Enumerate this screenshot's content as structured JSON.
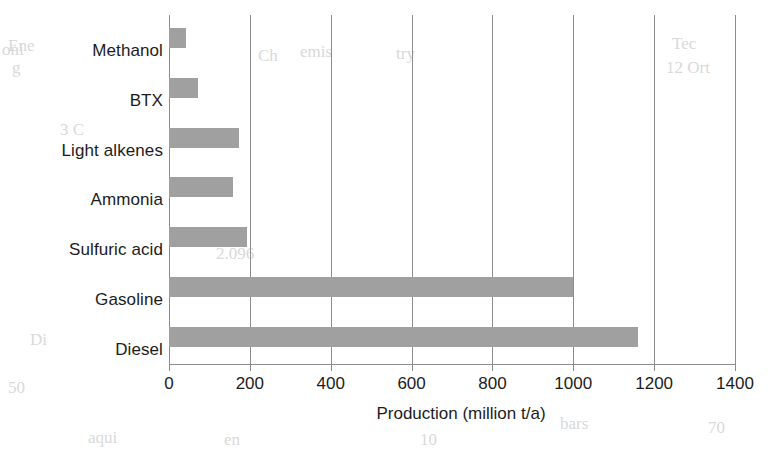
{
  "chart_data": {
    "type": "bar",
    "orientation": "horizontal",
    "title": "",
    "xlabel": "Production (million t/a)",
    "ylabel": "",
    "categories": [
      "Methanol",
      "BTX",
      "Light alkenes",
      "Ammonia",
      "Sulfuric acid",
      "Gasoline",
      "Diesel"
    ],
    "values": [
      42,
      72,
      173,
      158,
      193,
      1000,
      1160
    ],
    "xlim": [
      0,
      1400
    ],
    "xticks": [
      0,
      200,
      400,
      600,
      800,
      1000,
      1200,
      1400
    ],
    "xtick_labels": [
      "0",
      "200",
      "400",
      "600",
      "800",
      "1000",
      "1200",
      "1400"
    ],
    "grid": "vertical",
    "legend": "none",
    "bar_color": "#a0a0a0",
    "axis_color": "#8c8c8c",
    "background_color": "#ffffff"
  },
  "scan_artifacts": [
    {
      "text": "Ene",
      "left": 8,
      "top": 36
    },
    {
      "text": "oni",
      "left": 2,
      "top": 40
    },
    {
      "text": "g",
      "left": 12,
      "top": 58
    },
    {
      "text": "Ch",
      "left": 258,
      "top": 46
    },
    {
      "text": "emis",
      "left": 300,
      "top": 42
    },
    {
      "text": "try",
      "left": 396,
      "top": 44
    },
    {
      "text": "Tec",
      "left": 672,
      "top": 34
    },
    {
      "text": "12 Ort",
      "left": 666,
      "top": 58
    },
    {
      "text": "2.096",
      "left": 216,
      "top": 244
    },
    {
      "text": "Di",
      "left": 30,
      "top": 330
    },
    {
      "text": "3 C",
      "left": 60,
      "top": 120
    },
    {
      "text": "50",
      "left": 8,
      "top": 378
    },
    {
      "text": "aqui",
      "left": 88,
      "top": 428
    },
    {
      "text": "en",
      "left": 224,
      "top": 430
    },
    {
      "text": "10",
      "left": 420,
      "top": 430
    },
    {
      "text": "bars",
      "left": 560,
      "top": 414
    },
    {
      "text": "70",
      "left": 708,
      "top": 418
    }
  ]
}
